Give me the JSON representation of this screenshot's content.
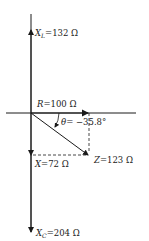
{
  "diagram": {
    "type": "impedance-phasor-diagram",
    "labels": {
      "xl": {
        "symbol": "X",
        "sub": "L",
        "value": "=132 Ω"
      },
      "r": {
        "symbol": "R",
        "value": "=100 Ω"
      },
      "theta": {
        "symbol": "θ",
        "value": "= −35.8°"
      },
      "x": {
        "symbol": "X",
        "value": "=72 Ω"
      },
      "z": {
        "symbol": "Z",
        "value": "=123 Ω"
      },
      "xc": {
        "symbol": "X",
        "sub": "C",
        "value": "=204 Ω"
      }
    },
    "colors": {
      "line": "#1a1a1a",
      "background": "#ffffff"
    }
  }
}
